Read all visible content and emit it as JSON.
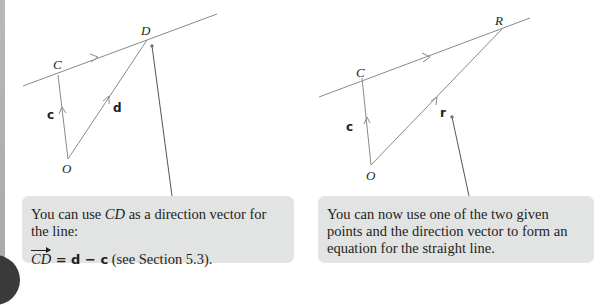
{
  "figures": {
    "left": {
      "points": {
        "C": "C",
        "D": "D",
        "O": "O"
      },
      "vectors": {
        "c": "c",
        "d": "d"
      },
      "callout": {
        "line1_pre": "You can use ",
        "line1_em": "CD",
        "line1_post": " as a direction vector for the line:",
        "line2_vec": "CD",
        "line2_eq": " = ",
        "line2_d": "d",
        "line2_minus": " − ",
        "line2_c": "c",
        "line2_post": " (see Section 5.3)."
      }
    },
    "right": {
      "points": {
        "C": "C",
        "R": "R",
        "O": "O"
      },
      "vectors": {
        "c": "c",
        "r": "r"
      },
      "callout": {
        "text": "You can now use one of the two given points and the direction vector to form an equation for the straight line."
      }
    }
  },
  "colors": {
    "line": "#8a8a8a",
    "callout_bg": "#e2e3e3",
    "text": "#231f20",
    "pointer": "#555555"
  }
}
